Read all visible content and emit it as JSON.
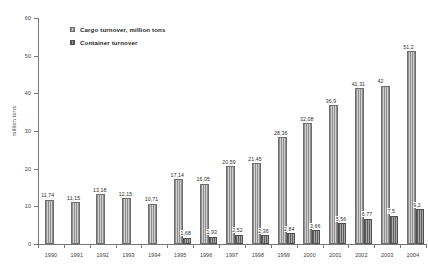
{
  "chart_data": {
    "type": "bar",
    "title": "",
    "xlabel": "",
    "ylabel": "million tons",
    "ylim": [
      0,
      60
    ],
    "yticks": [
      0,
      10,
      20,
      30,
      40,
      50,
      60
    ],
    "grid": false,
    "legend_position": "top-left",
    "categories": [
      "1990",
      "1991",
      "1992",
      "1993",
      "1994",
      "1995",
      "1996",
      "1997",
      "1998",
      "1999",
      "2000",
      "2001",
      "2002",
      "2003",
      "2004"
    ],
    "series": [
      {
        "name": "Cargo turnover, million tons",
        "color": "#a6a6a6",
        "values": [
          11.74,
          11.15,
          13.18,
          12.15,
          10.71,
          17.14,
          16.05,
          20.59,
          21.45,
          28.36,
          32.08,
          36.9,
          41.31,
          42,
          51.2
        ],
        "labels": [
          "11,74",
          "11,15",
          "13,18",
          "12,15",
          "10,71",
          "17,14",
          "16,05",
          "20,59",
          "21,45",
          "28,36",
          "32,08",
          "36,9",
          "41,31",
          "42",
          "51,2"
        ]
      },
      {
        "name": "Container turnover",
        "color": "#7d7d7d",
        "values": [
          null,
          null,
          null,
          null,
          null,
          1.68,
          1.93,
          2.52,
          2.36,
          2.84,
          3.66,
          5.56,
          6.77,
          7.5,
          9.2
        ],
        "labels": [
          "",
          "",
          "",
          "",
          "",
          "1,68",
          "1,93",
          "2,52",
          "2,36",
          "2,84",
          "3,66",
          "5,56",
          "6,77",
          "7,5",
          "9,2"
        ]
      }
    ]
  },
  "legend": {
    "items": [
      {
        "label": "Cargo turnover, million tons",
        "swatch": "cargo-swatch"
      },
      {
        "label": "Container turnover",
        "swatch": "container-swatch"
      }
    ]
  },
  "axes": {
    "y_title": "million tons",
    "y_tick_labels": [
      "60",
      "50",
      "40",
      "30",
      "20",
      "10",
      "0"
    ],
    "x_tick_labels": [
      "1990",
      "1991",
      "1992",
      "1993",
      "1994",
      "1995",
      "1996",
      "1997",
      "1998",
      "1999",
      "2000",
      "2001",
      "2002",
      "2003",
      "2004"
    ]
  }
}
